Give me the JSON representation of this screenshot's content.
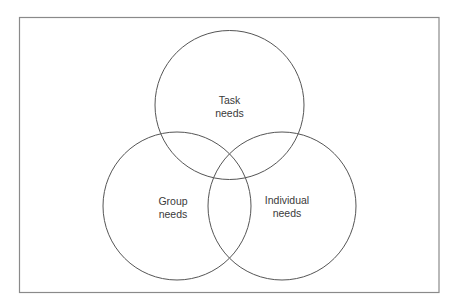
{
  "diagram": {
    "type": "venn",
    "frame": {
      "x": 19,
      "y": 17,
      "w": 420,
      "h": 276,
      "stroke": "#8a8a8a"
    },
    "circles": [
      {
        "id": "task",
        "cx": 229.5,
        "cy": 105,
        "r": 74,
        "label_lines": [
          "Task",
          "needs"
        ]
      },
      {
        "id": "group",
        "cx": 177,
        "cy": 206,
        "r": 74,
        "label_lines": [
          "Group",
          "needs"
        ]
      },
      {
        "id": "individual",
        "cx": 282,
        "cy": 206,
        "r": 74,
        "label_lines": [
          "Individual",
          "needs"
        ]
      }
    ],
    "stroke_color": "#555555"
  },
  "labels": {
    "task_1": "Task",
    "task_2": "needs",
    "group_1": "Group",
    "group_2": "needs",
    "individual_1": "Individual",
    "individual_2": "needs"
  }
}
